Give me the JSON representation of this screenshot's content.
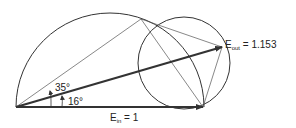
{
  "diagram": {
    "labels": {
      "e_out_main": "E",
      "e_out_sub": "out",
      "e_out_value": " = 1.153",
      "e_in_main": "E",
      "e_in_sub": "in",
      "e_in_value": " = 1",
      "angle_large": "35°",
      "angle_small": "16°"
    },
    "colors": {
      "stroke": "#333333",
      "background": "#ffffff"
    }
  }
}
